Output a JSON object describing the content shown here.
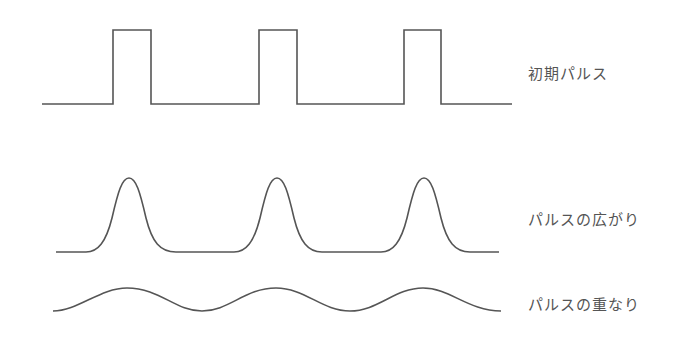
{
  "diagram": {
    "rows": [
      {
        "id": "initial",
        "label": "初期パルス",
        "shape": "rectangular-pulses",
        "baseline_y": 104,
        "peak_y": 30,
        "pulses_x": [
          [
            113,
            151
          ],
          [
            259,
            297
          ],
          [
            404,
            441
          ]
        ],
        "x_range": [
          42,
          512
        ]
      },
      {
        "id": "spread",
        "label": "パルスの広がり",
        "shape": "gaussian-pulses",
        "baseline_y": 252,
        "peak_y": 178,
        "peaks_x": [
          129,
          277,
          424
        ],
        "x_range": [
          56,
          499
        ]
      },
      {
        "id": "overlap",
        "label": "パルスの重なり",
        "shape": "sinusoid",
        "peak_y": 288,
        "trough_y": 311,
        "peaks_x": [
          127,
          276,
          423
        ],
        "x_range": [
          53,
          501
        ]
      }
    ],
    "line_color": "#555555"
  }
}
